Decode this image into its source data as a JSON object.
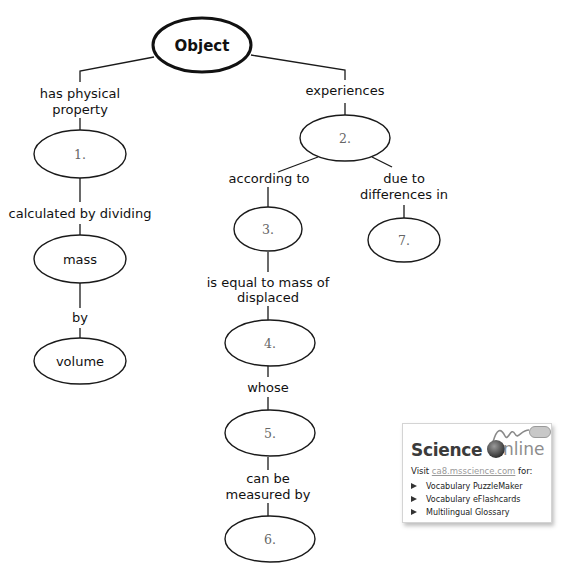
{
  "diagram": {
    "root": {
      "label": "Object"
    },
    "nodes": {
      "n1": {
        "label": "1."
      },
      "n2": {
        "label": "2."
      },
      "n3": {
        "label": "3."
      },
      "n4": {
        "label": "4."
      },
      "n5": {
        "label": "5."
      },
      "n6": {
        "label": "6."
      },
      "n7": {
        "label": "7."
      },
      "mass": {
        "label": "mass"
      },
      "volume": {
        "label": "volume"
      }
    },
    "links": {
      "has_physical_property": [
        "has physical",
        "property"
      ],
      "calculated_by_dividing": "calculated by dividing",
      "by": "by",
      "experiences": "experiences",
      "according_to": "according to",
      "due_to_differences_in": [
        "due to",
        "differences in"
      ],
      "is_equal_to_mass_of_displaced": [
        "is equal to mass of",
        "displaced"
      ],
      "whose": "whose",
      "can_be_measured_by": [
        "can be",
        "measured by"
      ]
    }
  },
  "science_online": {
    "logo_science": "Science",
    "logo_online": "nline",
    "visit_prefix": "Visit ",
    "visit_link": "ca8.msscience.com",
    "visit_suffix": " for:",
    "items": [
      "Vocabulary PuzzleMaker",
      "Vocabulary eFlashcards",
      "Multilingual Glossary"
    ],
    "icons": {
      "logo_globe": "globe-icon",
      "logo_mouse": "computer-mouse-icon",
      "bullet": "triangle-bullet-icon"
    }
  }
}
